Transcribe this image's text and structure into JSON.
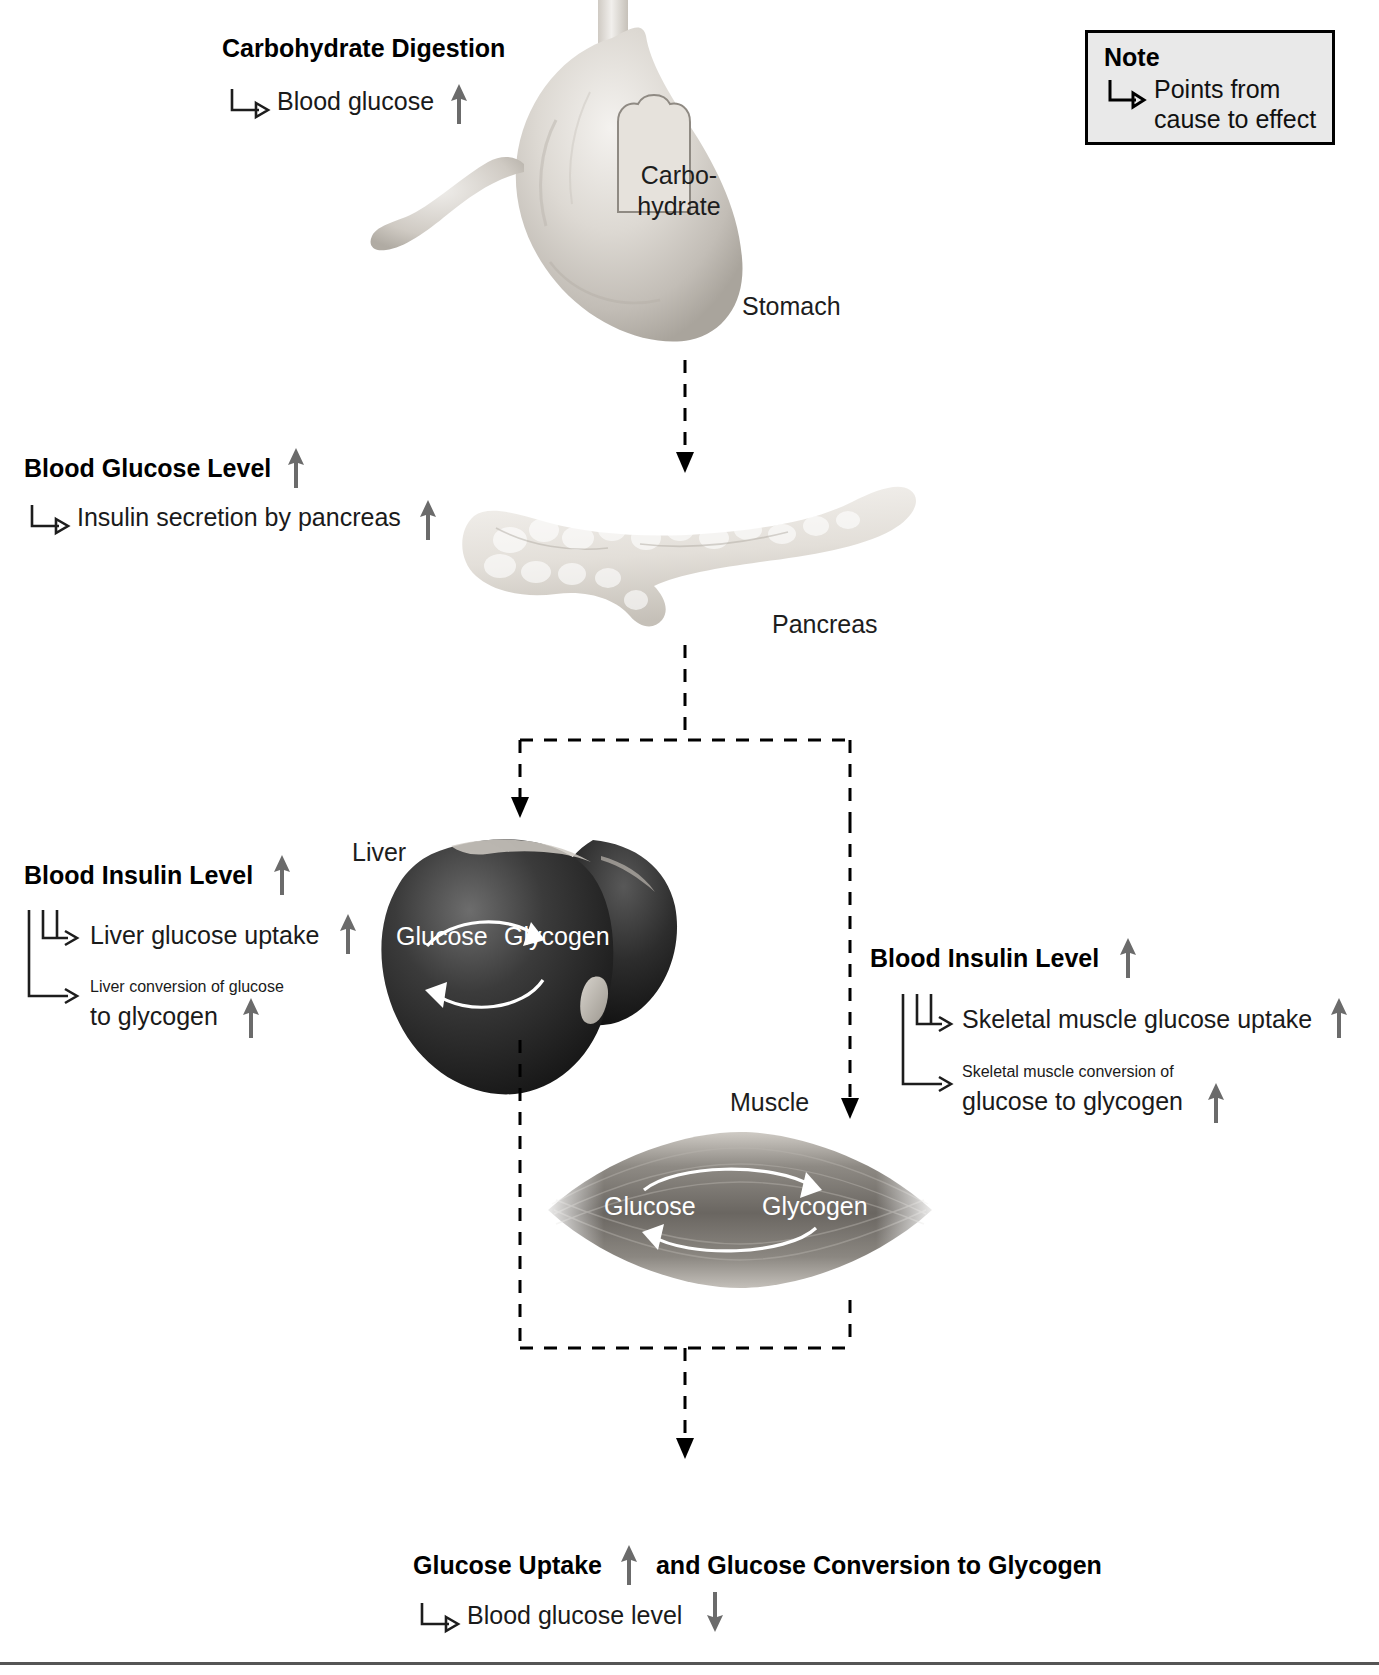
{
  "note": {
    "title": "Note",
    "line1": "Points from",
    "line2": "cause to effect",
    "icon": "cause-to-effect-hook-icon",
    "bg_color": "#e9e9e9",
    "border_color": "#000000"
  },
  "colors": {
    "text": "#1d1d1d",
    "up_arrow": "#6b6b6b",
    "down_arrow": "#6b6b6b",
    "flow_arrow": "#000000",
    "organ_light": "#d8d5d0",
    "organ_dark": "#2a2a2a"
  },
  "sections": {
    "carbohydrate_digestion": {
      "heading": "Carbohydrate Digestion",
      "items": [
        {
          "text": "Blood glucose",
          "trend": "up"
        }
      ]
    },
    "blood_glucose_level": {
      "heading": "Blood Glucose Level",
      "heading_trend": "up",
      "items": [
        {
          "text": "Insulin secretion by pancreas",
          "trend": "up"
        }
      ]
    },
    "blood_insulin_level_liver": {
      "heading": "Blood Insulin Level",
      "heading_trend": "up",
      "items": [
        {
          "text": "Liver glucose uptake",
          "trend": "up"
        },
        {
          "text": "Liver conversion of glucose to glycogen",
          "line1": "Liver conversion of glucose",
          "line2": "to glycogen",
          "trend": "up"
        }
      ]
    },
    "blood_insulin_level_muscle": {
      "heading": "Blood Insulin Level",
      "heading_trend": "up",
      "items": [
        {
          "text": "Skeletal muscle glucose uptake",
          "trend": "up"
        },
        {
          "text": "Skeletal muscle conversion of glucose to glycogen",
          "line1": "Skeletal muscle conversion of",
          "line2": "glucose to glycogen",
          "trend": "up"
        }
      ]
    },
    "summary": {
      "heading_part1": "Glucose Uptake",
      "heading_trend": "up",
      "heading_part2": "and Glucose Conversion to Glycogen",
      "items": [
        {
          "text": "Blood glucose level",
          "trend": "down"
        }
      ]
    }
  },
  "organs": {
    "stomach": {
      "label": "Stomach",
      "inset_line1": "Carbo-",
      "inset_line2": "hydrate"
    },
    "pancreas": {
      "label": "Pancreas"
    },
    "liver": {
      "label": "Liver",
      "cycle_left": "Glucose",
      "cycle_right": "Glycogen"
    },
    "muscle": {
      "label": "Muscle",
      "cycle_left": "Glucose",
      "cycle_right": "Glycogen"
    }
  }
}
